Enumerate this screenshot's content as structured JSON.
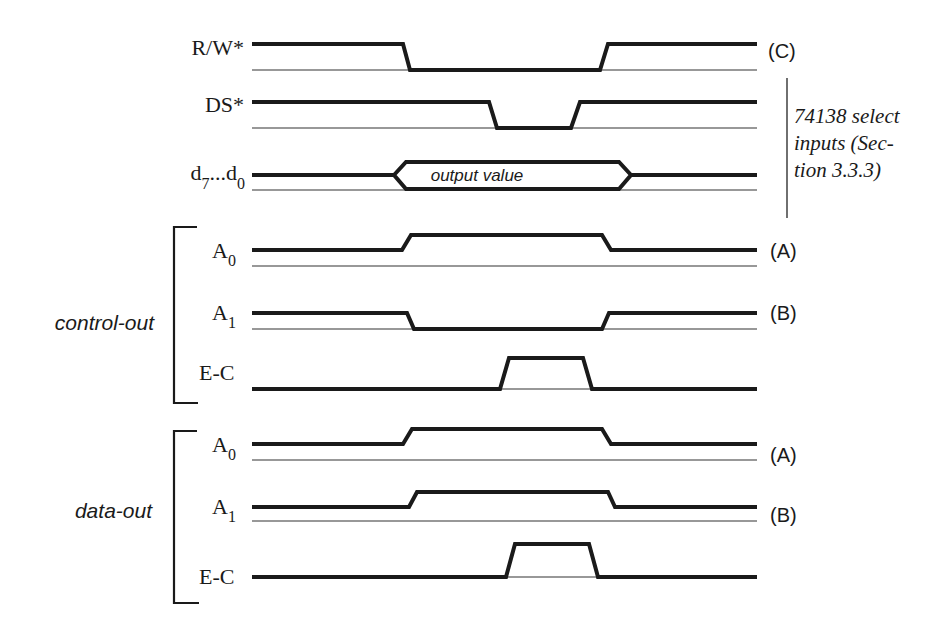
{
  "figure": {
    "type": "timing-diagram",
    "stroke_color": "#1a1a1a",
    "background": "#ffffff"
  },
  "signals": {
    "rw": {
      "label": "R/W*",
      "tag": "(C)"
    },
    "ds": {
      "label": "DS*"
    },
    "data_bus": {
      "label_main": "d",
      "sub1": "7",
      "mid": "...d",
      "sub2": "0",
      "bus_value": "output value"
    }
  },
  "annotation": {
    "lines": [
      "74138 select",
      "inputs (Sec-",
      "tion 3.3.3)"
    ]
  },
  "groups": [
    {
      "label": "control-out",
      "signals": [
        {
          "label": "A",
          "sub": "0",
          "tag": "(A)"
        },
        {
          "label": "A",
          "sub": "1",
          "tag": "(B)"
        },
        {
          "label": "E-C",
          "tag": ""
        }
      ]
    },
    {
      "label": "data-out",
      "signals": [
        {
          "label": "A",
          "sub": "0",
          "tag": "(A)"
        },
        {
          "label": "A",
          "sub": "1",
          "tag": "(B)"
        },
        {
          "label": "E-C",
          "tag": ""
        }
      ]
    }
  ]
}
